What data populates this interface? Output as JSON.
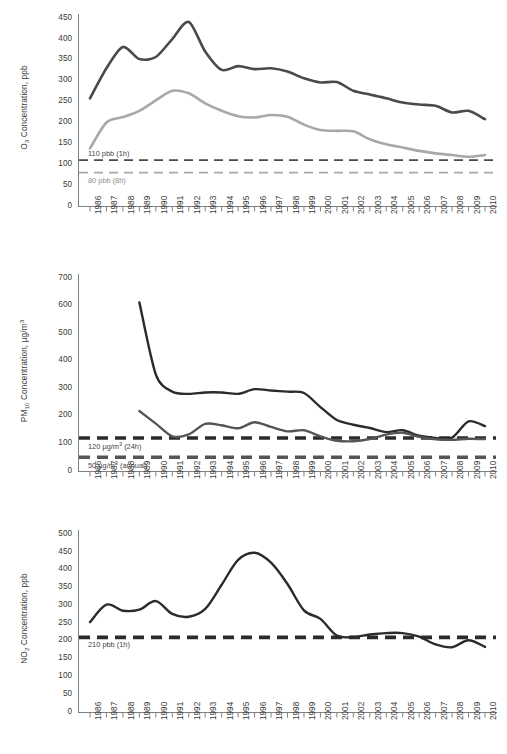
{
  "figure": {
    "title": "",
    "x_years": [
      "1986",
      "1987",
      "1988",
      "1989",
      "1990",
      "1991",
      "1992",
      "1993",
      "1994",
      "1995",
      "1996",
      "1997",
      "1998",
      "1999",
      "2000",
      "2001",
      "2002",
      "2003",
      "2004",
      "2005",
      "2006",
      "2007",
      "2008",
      "2009",
      "2010"
    ]
  },
  "colors": {
    "dark": "#4a4a4a",
    "light": "#a8a8a8",
    "black": "#2b2b2b",
    "axis": "#808080",
    "text": "#3a3a3a"
  },
  "panels": [
    {
      "id": "o3",
      "pollutant": "O",
      "pollutant_sub": "3",
      "axis_title_main": "Concentration, ppb",
      "y_ticks": [
        0,
        50,
        100,
        150,
        200,
        250,
        300,
        350,
        400,
        450
      ],
      "y_tick_labels": [
        "0",
        "50",
        "100",
        "150",
        "200",
        "250",
        "300",
        "350",
        "400",
        "450"
      ],
      "ylim": [
        0,
        460
      ],
      "thresholds": [
        {
          "label": "110 pbb (1h)",
          "value": 110,
          "color": "#4a4a4a"
        },
        {
          "label": "80 pbb (8h)",
          "value": 80,
          "color": "#a8a8a8"
        }
      ]
    },
    {
      "id": "pm10",
      "pollutant": "PM",
      "pollutant_sub": "10",
      "axis_title_main": "Concentration, µg/m³",
      "y_ticks": [
        0,
        100,
        200,
        300,
        400,
        500,
        600,
        700
      ],
      "y_tick_labels": [
        "0",
        "100",
        "200",
        "300",
        "400",
        "500",
        "600",
        "700"
      ],
      "ylim": [
        0,
        715
      ],
      "thresholds": [
        {
          "label": "120 µg/m³ (24h)",
          "value": 120,
          "color": "#2b2b2b"
        },
        {
          "label": "50 µg/m³ (annual)",
          "value": 50,
          "color": "#555555"
        }
      ]
    },
    {
      "id": "no2",
      "pollutant": "NO",
      "pollutant_sub": "2",
      "axis_title_main": "Concentration, ppb",
      "y_ticks": [
        0,
        50,
        100,
        150,
        200,
        250,
        300,
        350,
        400,
        450,
        500
      ],
      "y_tick_labels": [
        "0",
        "50",
        "100",
        "150",
        "200",
        "250",
        "300",
        "350",
        "400",
        "450",
        "500"
      ],
      "ylim": [
        0,
        512
      ],
      "thresholds": [
        {
          "label": "210 pbb (1h)",
          "value": 210,
          "color": "#2b2b2b"
        }
      ]
    }
  ],
  "chart_data": [
    {
      "type": "line",
      "id": "o3",
      "title": "O3 Concentration, ppb",
      "xlabel": "",
      "ylabel": "O3 Concentration, ppb",
      "ylim": [
        0,
        460
      ],
      "grid": false,
      "legend": "none",
      "x": [
        "1986",
        "1987",
        "1988",
        "1989",
        "1990",
        "1991",
        "1992",
        "1993",
        "1994",
        "1995",
        "1996",
        "1997",
        "1998",
        "1999",
        "2000",
        "2001",
        "2002",
        "2003",
        "2004",
        "2005",
        "2006",
        "2007",
        "2008",
        "2009",
        "2010"
      ],
      "series": [
        {
          "name": "O3 1-hour maximum",
          "color": "#4a4a4a",
          "values": [
            258,
            330,
            381,
            352,
            357,
            400,
            441,
            370,
            326,
            335,
            328,
            330,
            322,
            306,
            296,
            297,
            276,
            267,
            258,
            248,
            243,
            240,
            224,
            228,
            208
          ]
        },
        {
          "name": "O3 8-hour maximum",
          "color": "#a8a8a8",
          "values": [
            138,
            200,
            213,
            228,
            253,
            276,
            270,
            246,
            228,
            215,
            212,
            218,
            214,
            195,
            182,
            180,
            179,
            160,
            148,
            140,
            132,
            126,
            122,
            118,
            122
          ]
        }
      ],
      "threshold_lines": [
        {
          "label": "110 pbb (1h)",
          "value": 110,
          "style": "dashed",
          "color": "#4a4a4a"
        },
        {
          "label": "80 pbb (8h)",
          "value": 80,
          "style": "dashed",
          "color": "#a8a8a8"
        }
      ]
    },
    {
      "type": "line",
      "id": "pm10",
      "title": "PM10 Concentration, µg/m³",
      "xlabel": "",
      "ylabel": "PM10 Concentration, µg/m³",
      "ylim": [
        0,
        715
      ],
      "grid": false,
      "legend": "none",
      "x": [
        "1986",
        "1987",
        "1988",
        "1989",
        "1990",
        "1991",
        "1992",
        "1993",
        "1994",
        "1995",
        "1996",
        "1997",
        "1998",
        "1999",
        "2000",
        "2001",
        "2002",
        "2003",
        "2004",
        "2005",
        "2006",
        "2007",
        "2008",
        "2009",
        "2010"
      ],
      "series": [
        {
          "name": "PM10 24-hour maximum",
          "color": "#2b2b2b",
          "start_year": "1989",
          "values": [
            null,
            null,
            null,
            612,
            350,
            288,
            280,
            285,
            285,
            280,
            297,
            292,
            288,
            283,
            232,
            185,
            168,
            156,
            141,
            148,
            128,
            120,
            121,
            180,
            163
          ]
        },
        {
          "name": "PM10 annual mean",
          "color": "#555555",
          "start_year": "1989",
          "values": [
            null,
            null,
            null,
            218,
            172,
            126,
            133,
            171,
            166,
            155,
            177,
            160,
            144,
            148,
            126,
            110,
            108,
            116,
            132,
            139,
            124,
            115,
            113,
            117,
            116
          ]
        }
      ],
      "threshold_lines": [
        {
          "label": "120 µg/m³ (24h)",
          "value": 120,
          "style": "dashed",
          "color": "#2b2b2b"
        },
        {
          "label": "50 µg/m³ (annual)",
          "value": 50,
          "style": "dashed",
          "color": "#555555"
        }
      ]
    },
    {
      "type": "line",
      "id": "no2",
      "title": "NO2 Concentration, ppb",
      "xlabel": "",
      "ylabel": "NO2 Concentration, ppb",
      "ylim": [
        0,
        512
      ],
      "grid": false,
      "legend": "none",
      "x": [
        "1986",
        "1987",
        "1988",
        "1989",
        "1990",
        "1991",
        "1992",
        "1993",
        "1994",
        "1995",
        "1996",
        "1997",
        "1998",
        "1999",
        "2000",
        "2001",
        "2002",
        "2003",
        "2004",
        "2005",
        "2006",
        "2007",
        "2008",
        "2009",
        "2010"
      ],
      "series": [
        {
          "name": "NO2 1-hour maximum",
          "color": "#2b2b2b",
          "values": [
            253,
            302,
            285,
            288,
            312,
            276,
            268,
            290,
            358,
            428,
            448,
            420,
            360,
            286,
            262,
            215,
            211,
            218,
            222,
            222,
            212,
            190,
            182,
            202,
            183
          ]
        }
      ],
      "threshold_lines": [
        {
          "label": "210 pbb (1h)",
          "value": 210,
          "style": "dashed",
          "color": "#2b2b2b"
        }
      ]
    }
  ]
}
